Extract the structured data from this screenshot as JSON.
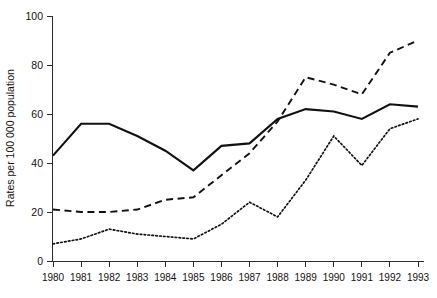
{
  "chart_data": {
    "type": "line",
    "title": "",
    "xlabel": "",
    "ylabel": "Rates per 100 000 population",
    "categories": [
      "1980",
      "1981",
      "1982",
      "1983",
      "1984",
      "1985",
      "1986",
      "1987",
      "1988",
      "1989",
      "1990",
      "1991",
      "1992",
      "1993"
    ],
    "x": [
      1980,
      1981,
      1982,
      1983,
      1984,
      1985,
      1986,
      1987,
      1988,
      1989,
      1990,
      1991,
      1992,
      1993
    ],
    "xlim": [
      1980,
      1993
    ],
    "ylim": [
      0,
      100
    ],
    "yticks": [
      0,
      20,
      40,
      60,
      80,
      100
    ],
    "ytick_labels": [
      "0",
      "20",
      "40",
      "60",
      "80",
      "100"
    ],
    "grid": false,
    "legend": "none",
    "series": [
      {
        "name": "solid-series",
        "style": "solid",
        "color": "#111111",
        "values": [
          43,
          56,
          56,
          51,
          45,
          37,
          47,
          48,
          58,
          62,
          61,
          58,
          64,
          63
        ]
      },
      {
        "name": "dashed-series",
        "style": "dashed",
        "color": "#111111",
        "values": [
          21,
          20,
          20,
          21,
          25,
          26,
          35,
          44,
          57,
          75,
          72,
          68,
          85,
          90
        ]
      },
      {
        "name": "dotted-series",
        "style": "dotted",
        "color": "#111111",
        "values": [
          7,
          9,
          13,
          11,
          10,
          9,
          15,
          24,
          18,
          33,
          51,
          39,
          54,
          58
        ]
      }
    ]
  },
  "axes": {
    "y_axis_title": "Rates per 100 000 population"
  }
}
